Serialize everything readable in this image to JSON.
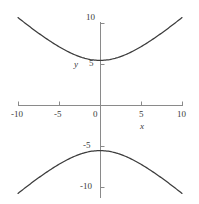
{
  "figure": {
    "corner_mark": "",
    "background_color": "#ffffff",
    "curve_color": "#3c3c3c",
    "axis_color": "#8a8a8a",
    "label_color": "#3a3a3a"
  },
  "axes": {
    "x_name": "x",
    "y_name": "y",
    "x_ticks": [
      "-10",
      "-5",
      "0",
      "5",
      "10"
    ],
    "y_ticks": [
      "10",
      "5",
      "-5",
      "-10"
    ]
  },
  "chart_data": {
    "type": "line",
    "title": "",
    "subtitle": "",
    "xlabel": "x",
    "ylabel": "y",
    "xlim": [
      -10,
      10
    ],
    "ylim": [
      -10,
      10
    ],
    "xticks": [
      -10,
      -5,
      0,
      5,
      10
    ],
    "yticks": [
      10,
      5,
      -5,
      -10
    ],
    "xticklabels": [
      "-10",
      "-5",
      "0",
      "5",
      "10"
    ],
    "yticklabels": [
      "10",
      "5",
      "-5",
      "-10"
    ],
    "grid": false,
    "legend": false,
    "legend_position": "none",
    "annotations": [],
    "equation": "y^2/5.5^2 - x^2/6^2 = 1",
    "vertices": [
      [
        0,
        5.5
      ],
      [
        0,
        -5.5
      ]
    ],
    "asymptote_slopes": [
      0.92,
      -0.92
    ],
    "series": [
      {
        "name": "upper-branch",
        "comment": "y = +5.5 * sqrt(1 + x^2/36)",
        "x": [
          -10,
          -9,
          -8,
          -7,
          -6,
          -5,
          -4,
          -3,
          -2,
          -1,
          0,
          1,
          2,
          3,
          4,
          5,
          6,
          7,
          8,
          9,
          10
        ],
        "y": [
          10.66,
          9.92,
          9.18,
          8.46,
          7.78,
          7.26,
          6.61,
          6.15,
          5.79,
          5.58,
          5.5,
          5.58,
          5.79,
          6.15,
          6.61,
          7.26,
          7.78,
          8.46,
          9.18,
          9.92,
          10.66
        ]
      },
      {
        "name": "lower-branch",
        "comment": "y = -5.5 * sqrt(1 + x^2/36)",
        "x": [
          -10,
          -9,
          -8,
          -7,
          -6,
          -5,
          -4,
          -3,
          -2,
          -1,
          0,
          1,
          2,
          3,
          4,
          5,
          6,
          7,
          8,
          9,
          10
        ],
        "y": [
          -10.66,
          -9.92,
          -9.18,
          -8.46,
          -7.78,
          -7.26,
          -6.61,
          -6.15,
          -5.79,
          -5.58,
          -5.5,
          -5.58,
          -5.79,
          -6.15,
          -6.61,
          -7.26,
          -7.78,
          -8.46,
          -9.18,
          -9.92,
          -10.66
        ]
      }
    ]
  }
}
